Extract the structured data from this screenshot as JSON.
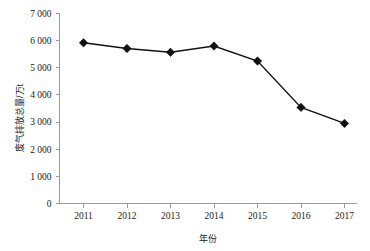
{
  "chart_data": {
    "type": "line",
    "title": "",
    "subtitle": "",
    "xlabel": "年份",
    "ylabel": "废气排放总量/万t",
    "categories": [
      "2011",
      "2012",
      "2013",
      "2014",
      "2015",
      "2016",
      "2017"
    ],
    "x": [
      2011,
      2012,
      2013,
      2014,
      2015,
      2016,
      2017
    ],
    "values": [
      5920,
      5710,
      5570,
      5800,
      5250,
      3540,
      2950
    ],
    "series": [
      {
        "name": "废气排放总量",
        "values": [
          5920,
          5710,
          5570,
          5800,
          5250,
          3540,
          2950
        ]
      }
    ],
    "ylim": [
      0,
      7000
    ],
    "yticks": [
      0,
      1000,
      2000,
      3000,
      4000,
      5000,
      6000,
      7000
    ],
    "ytick_labels": [
      "0",
      "1 000",
      "2 000",
      "3 000",
      "4 000",
      "5 000",
      "6 000",
      "7 000"
    ],
    "xtick_labels": [
      "2011",
      "2012",
      "2013",
      "2014",
      "2015",
      "2016",
      "2017"
    ],
    "grid": false,
    "legend": false,
    "legend_position": "none",
    "marker": "diamond",
    "line_color": "#111111",
    "marker_color": "#111111",
    "axis_color": "#9a9a9a",
    "background_color": "#ffffff",
    "annotations": []
  },
  "axes": {
    "y_axis_title": "废气排放总量/万t",
    "x_axis_title": "年份"
  }
}
